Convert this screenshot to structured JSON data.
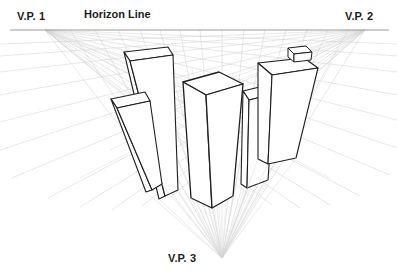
{
  "diagram": {
    "type": "perspective-drawing",
    "background_color": "#ffffff",
    "labels": {
      "vp1": "V.P. 1",
      "vp2": "V.P. 2",
      "vp3": "V.P. 3",
      "horizon": "Horizon Line"
    },
    "colors": {
      "guide_line": "#c9c9c9",
      "guide_line_faint": "#dedede",
      "horizon_line": "#9a9a9a",
      "building_outline": "#1e1e1e",
      "building_fill": "#ffffff",
      "text": "#1b1b1b"
    },
    "vanishing_points": {
      "vp1": {
        "x": 45,
        "y": 30,
        "name": "V.P. 1",
        "position": "left"
      },
      "vp2": {
        "x": 365,
        "y": 30,
        "name": "V.P. 2",
        "position": "right"
      },
      "vp3": {
        "x": 222,
        "y": 258,
        "name": "V.P. 3",
        "position": "bottom"
      }
    },
    "horizon_line": {
      "x1": 10,
      "y1": 30,
      "x2": 389,
      "y2": 30
    },
    "guide_targets": [
      {
        "x": 110,
        "y": 55
      },
      {
        "x": 140,
        "y": 60
      },
      {
        "x": 170,
        "y": 70
      },
      {
        "x": 200,
        "y": 78
      },
      {
        "x": 232,
        "y": 86
      },
      {
        "x": 262,
        "y": 94
      },
      {
        "x": 290,
        "y": 100
      },
      {
        "x": 318,
        "y": 108
      },
      {
        "x": 120,
        "y": 120
      },
      {
        "x": 160,
        "y": 140
      },
      {
        "x": 200,
        "y": 160
      },
      {
        "x": 245,
        "y": 150
      },
      {
        "x": 275,
        "y": 135
      },
      {
        "x": 150,
        "y": 190
      },
      {
        "x": 215,
        "y": 205
      },
      {
        "x": 265,
        "y": 185
      }
    ],
    "buildings": [
      {
        "id": "b1",
        "name": "tall-left-slab",
        "top_y": 48
      },
      {
        "id": "b2",
        "name": "left-front-slab",
        "top_y": 96
      },
      {
        "id": "b3",
        "name": "center-tower",
        "top_y": 74
      },
      {
        "id": "b4",
        "name": "mid-right-block",
        "top_y": 92
      },
      {
        "id": "b5",
        "name": "right-tower-with-penthouse",
        "top_y": 58
      },
      {
        "id": "b6",
        "name": "penthouse-box",
        "top_y": 44
      }
    ]
  }
}
